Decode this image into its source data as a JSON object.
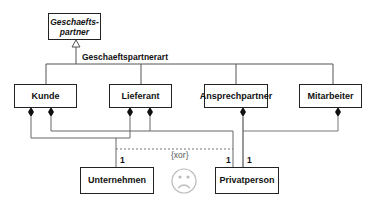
{
  "diagram": {
    "type": "UML class diagram",
    "superclass": {
      "name": "Geschaefts-\npartner",
      "line1": "Geschaefts-",
      "line2": "partner",
      "abstract": true
    },
    "generalization_label": "Geschaeftspartnerart",
    "subclasses": [
      {
        "name": "Kunde"
      },
      {
        "name": "Lieferant"
      },
      {
        "name": "Ansprechpartner"
      },
      {
        "name": "Mitarbeiter"
      }
    ],
    "parts": [
      {
        "name": "Unternehmen"
      },
      {
        "name": "Privatperson"
      }
    ],
    "multiplicities": {
      "unternehmen": "1",
      "privatperson_left": "1",
      "privatperson_right": "1"
    },
    "constraint": "{xor}",
    "annotation_icon": "frown-face-icon",
    "colors": {
      "line": "#555555",
      "box_border": "#222222",
      "thick_line": "#aaaaaa"
    }
  }
}
